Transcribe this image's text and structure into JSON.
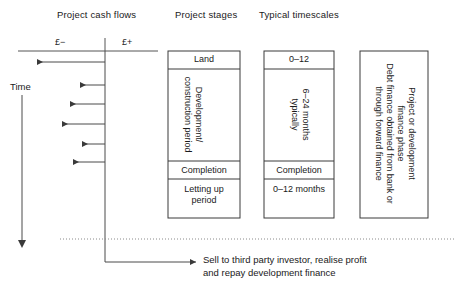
{
  "headers": {
    "cash_flows": "Project cash flows",
    "stages": "Project stages",
    "timescales": "Typical timescales"
  },
  "axis": {
    "negative": "£−",
    "positive": "£+",
    "time": "Time"
  },
  "stages_box": {
    "land": "Land",
    "development_line1": "Development/",
    "development_line2": "construction period",
    "completion": "Completion",
    "letting_line1": "Letting up",
    "letting_line2": "period"
  },
  "timescales_box": {
    "land_duration": "0–12",
    "construction_line1": "6–24 months",
    "construction_line2": "typically",
    "completion": "Completion",
    "letting_duration": "0–12 months"
  },
  "finance_box": {
    "line1": "Project or development",
    "line2": "finance phase",
    "line3": "Debt finance obtained from bank or",
    "line4": "through forward finance"
  },
  "outcome": {
    "line1": "Sell to third party investor, realise profit",
    "line2": "and repay development finance"
  },
  "chart_data": {
    "type": "diagram",
    "cash_flow_arrows": [
      {
        "index": 1,
        "y": 62,
        "from_x": 105,
        "to_x": 37
      },
      {
        "index": 2,
        "y": 85,
        "from_x": 105,
        "to_x": 80
      },
      {
        "index": 3,
        "y": 104,
        "from_x": 105,
        "to_x": 70
      },
      {
        "index": 4,
        "y": 124,
        "from_x": 105,
        "to_x": 62
      },
      {
        "index": 5,
        "y": 144,
        "from_x": 105,
        "to_x": 82
      },
      {
        "index": 6,
        "y": 162,
        "from_x": 105,
        "to_x": 73
      }
    ],
    "zero_axis_x": 105,
    "axis_y": 51,
    "dotted_line_y": 239
  }
}
